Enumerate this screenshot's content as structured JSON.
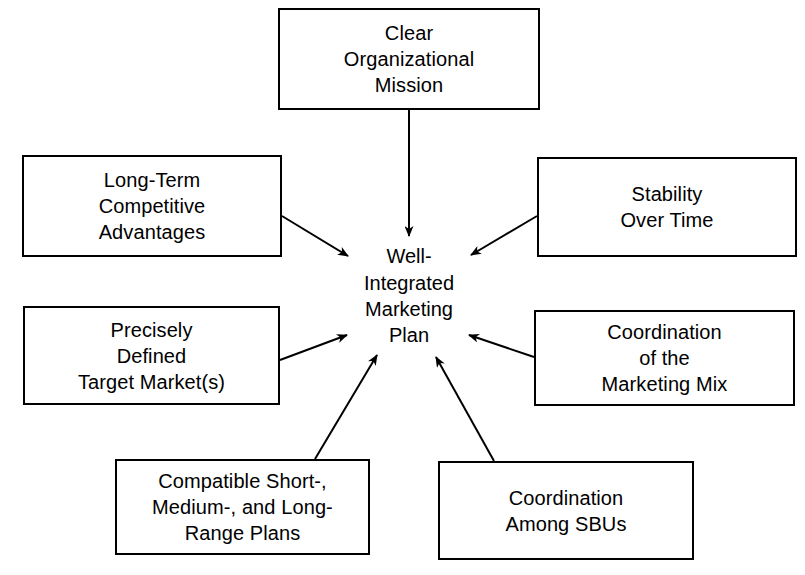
{
  "diagram": {
    "type": "concept-map",
    "background_color": "#ffffff",
    "line_color": "#000000",
    "center": {
      "id": "center",
      "lines": [
        "Well-",
        "Integrated",
        "Marketing",
        "Plan"
      ]
    },
    "nodes": [
      {
        "id": "mission",
        "lines": [
          "Clear",
          "Organizational",
          "Mission"
        ],
        "x": 278,
        "y": 8,
        "w": 262,
        "h": 102
      },
      {
        "id": "long-term-competitive-advantages",
        "lines": [
          "Long-Term",
          "Competitive",
          "Advantages"
        ],
        "x": 22,
        "y": 155,
        "w": 260,
        "h": 102
      },
      {
        "id": "stability-over-time",
        "lines": [
          "Stability",
          "Over Time"
        ],
        "x": 537,
        "y": 157,
        "w": 260,
        "h": 100
      },
      {
        "id": "precisely-defined-target-markets",
        "lines": [
          "Precisely",
          "Defined",
          "Target Market(s)"
        ],
        "x": 23,
        "y": 306,
        "w": 257,
        "h": 99
      },
      {
        "id": "coordination-of-the-marketing-mix",
        "lines": [
          "Coordination",
          "of the",
          "Marketing Mix"
        ],
        "x": 534,
        "y": 310,
        "w": 261,
        "h": 96
      },
      {
        "id": "compatible-plans",
        "lines": [
          "Compatible Short-,",
          "Medium-, and Long-",
          "Range Plans"
        ],
        "x": 115,
        "y": 459,
        "w": 255,
        "h": 96
      },
      {
        "id": "coordination-among-sbus",
        "lines": [
          "Coordination",
          "Among SBUs"
        ],
        "x": 438,
        "y": 461,
        "w": 256,
        "h": 99
      }
    ],
    "arrows": [
      {
        "id": "arrow-mission-to-center",
        "from": "mission",
        "to": "center",
        "x1": 409,
        "y1": 110,
        "x2": 409,
        "y2": 236
      },
      {
        "id": "arrow-advantages-to-center",
        "from": "long-term-competitive-advantages",
        "to": "center",
        "x1": 282,
        "y1": 216,
        "x2": 348,
        "y2": 256
      },
      {
        "id": "arrow-stability-to-center",
        "from": "stability-over-time",
        "to": "center",
        "x1": 537,
        "y1": 216,
        "x2": 471,
        "y2": 255
      },
      {
        "id": "arrow-target-markets-to-center",
        "from": "precisely-defined-target-markets",
        "to": "center",
        "x1": 280,
        "y1": 360,
        "x2": 347,
        "y2": 335
      },
      {
        "id": "arrow-marketing-mix-to-center",
        "from": "coordination-of-the-marketing-mix",
        "to": "center",
        "x1": 534,
        "y1": 357,
        "x2": 469,
        "y2": 335
      },
      {
        "id": "arrow-compatible-plans-to-center",
        "from": "compatible-plans",
        "to": "center",
        "x1": 315,
        "y1": 459,
        "x2": 377,
        "y2": 355
      },
      {
        "id": "arrow-sbus-to-center",
        "from": "coordination-among-sbus",
        "to": "center",
        "x1": 494,
        "y1": 461,
        "x2": 436,
        "y2": 357
      }
    ]
  }
}
